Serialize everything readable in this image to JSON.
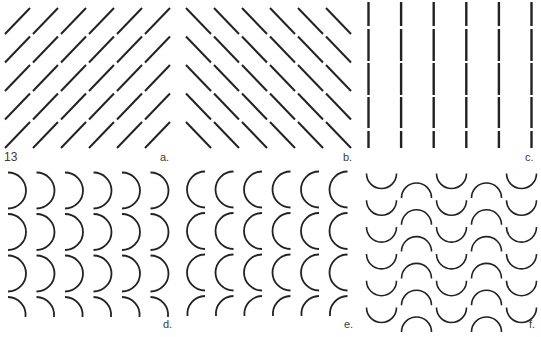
{
  "figure_number": "13",
  "panels": [
    {
      "id": "a",
      "label": "a.",
      "pattern": "diagonal-lines-ascending",
      "columns": 6,
      "rows": 5
    },
    {
      "id": "b",
      "label": "b.",
      "pattern": "diagonal-lines-descending",
      "columns": 6,
      "rows": 5
    },
    {
      "id": "c",
      "label": "c.",
      "pattern": "vertical-dashed-lines",
      "columns": 6,
      "segments_per_line": 5
    },
    {
      "id": "d",
      "label": "d.",
      "pattern": "right-facing-semicircle-arcs",
      "columns": 6,
      "rows": 4
    },
    {
      "id": "e",
      "label": "e.",
      "pattern": "left-facing-semicircle-arcs",
      "columns": 6,
      "rows": 4
    },
    {
      "id": "f",
      "label": "f.",
      "pattern": "alternating-cup-and-cap-arcs",
      "columns": 5,
      "rows": 6
    }
  ],
  "colors": {
    "stroke": "#222222",
    "background": "#ffffff",
    "label": "#3a3a3a"
  }
}
